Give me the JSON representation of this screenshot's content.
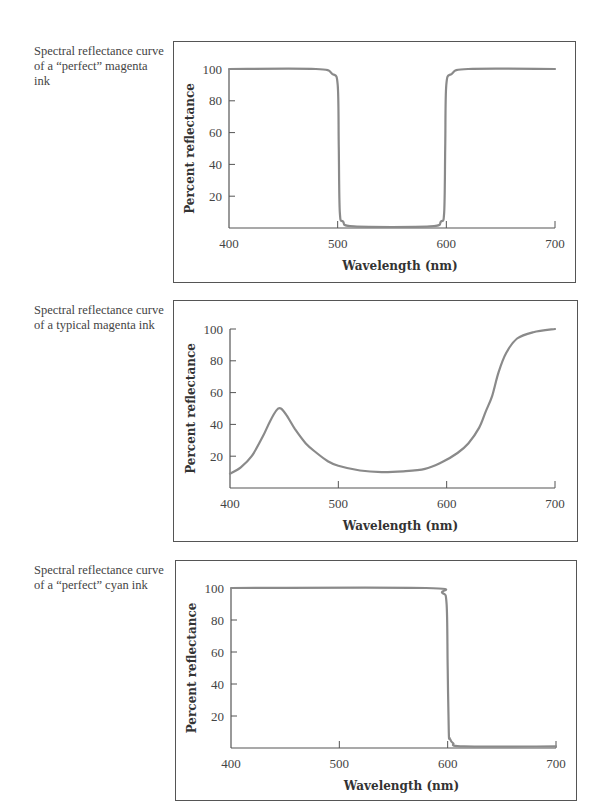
{
  "figure": {
    "panels": [
      {
        "caption": "Spectral reflectance curve of a “perfect” magenta ink"
      },
      {
        "caption": "Spectral reflectance curve of a typical magenta ink"
      },
      {
        "caption": "Spectral reflectance curve of a “perfect” cyan ink"
      }
    ],
    "colors": {
      "curve": "#8a8a8a",
      "axis": "#555555",
      "frame": "#555555",
      "text": "#444444"
    }
  },
  "chart_data": [
    {
      "type": "line",
      "title": "Spectral reflectance curve of a “perfect” magenta ink",
      "xlabel": "Wavelength (nm)",
      "ylabel": "Percent reflectance",
      "xlim": [
        400,
        700
      ],
      "ylim": [
        0,
        100
      ],
      "x_ticks": [
        400,
        500,
        600,
        700
      ],
      "y_ticks": [
        20,
        40,
        60,
        80,
        100
      ],
      "grid": false,
      "series": [
        {
          "name": "perfect magenta",
          "x": [
            400,
            480,
            495,
            500,
            501,
            502,
            505,
            515,
            585,
            595,
            598,
            599,
            600,
            605,
            620,
            700
          ],
          "y": [
            100,
            100,
            97,
            90,
            50,
            10,
            4,
            1,
            1,
            4,
            10,
            50,
            90,
            97,
            100,
            100
          ]
        }
      ]
    },
    {
      "type": "line",
      "title": "Spectral reflectance curve of a typical magenta ink",
      "xlabel": "Wavelength (nm)",
      "ylabel": "Percent reflectance",
      "xlim": [
        400,
        700
      ],
      "ylim": [
        0,
        100
      ],
      "x_ticks": [
        400,
        500,
        600,
        700
      ],
      "y_ticks": [
        20,
        40,
        60,
        80,
        100
      ],
      "grid": false,
      "series": [
        {
          "name": "typical magenta",
          "x": [
            400,
            410,
            420,
            430,
            437,
            443,
            447,
            452,
            460,
            470,
            480,
            490,
            500,
            520,
            540,
            560,
            580,
            595,
            610,
            620,
            630,
            636,
            642,
            648,
            655,
            665,
            680,
            700
          ],
          "y": [
            9,
            13,
            20,
            32,
            42,
            49,
            50,
            46,
            37,
            28,
            22,
            17,
            14,
            11,
            10,
            10.5,
            12,
            16,
            22,
            28,
            38,
            48,
            58,
            73,
            85,
            94,
            98,
            100
          ]
        }
      ]
    },
    {
      "type": "line",
      "title": "Spectral reflectance curve of a “perfect” cyan ink",
      "xlabel": "Wavelength (nm)",
      "ylabel": "Percent reflectance",
      "xlim": [
        400,
        700
      ],
      "ylim": [
        0,
        100
      ],
      "x_ticks": [
        400,
        500,
        600,
        700
      ],
      "y_ticks": [
        20,
        40,
        60,
        80,
        100
      ],
      "grid": false,
      "series": [
        {
          "name": "perfect cyan",
          "x": [
            400,
            580,
            595,
            599,
            600,
            601,
            602,
            605,
            615,
            700
          ],
          "y": [
            100,
            100,
            97,
            90,
            50,
            10,
            6,
            3,
            1,
            1
          ]
        }
      ]
    }
  ]
}
